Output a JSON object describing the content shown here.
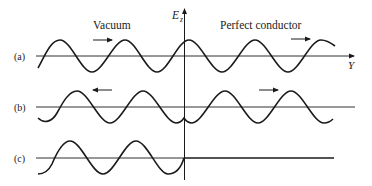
{
  "diagram": {
    "regions": {
      "left": "Vacuum",
      "right": "Perfect conductor"
    },
    "vertical_axis_label": "E",
    "vertical_axis_subscript": "z",
    "horizontal_axis_label": "Y",
    "rows": [
      {
        "label": "(a)",
        "description": "traveling wave continuing across boundary",
        "arrows": [
          "right",
          "right"
        ]
      },
      {
        "label": "(b)",
        "description": "incident and reflected waves",
        "arrows": [
          "left",
          "right"
        ]
      },
      {
        "label": "(c)",
        "description": "wave in vacuum, zero field in perfect conductor",
        "arrows": []
      }
    ],
    "colors": {
      "ink": "#1a1a1a",
      "background": "#ffffff"
    }
  }
}
